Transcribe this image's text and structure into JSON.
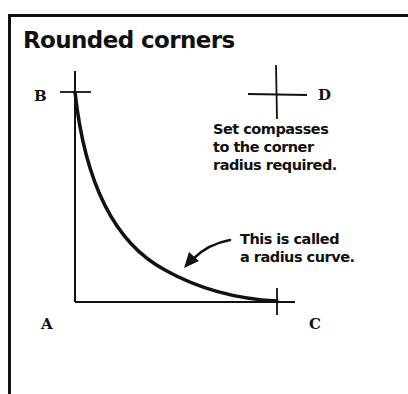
{
  "title": "Rounded corners",
  "points": {
    "A": "A",
    "B": "B",
    "C": "C",
    "D": "D"
  },
  "instruction": {
    "lines": [
      "Set compasses",
      "to the corner",
      "radius required."
    ]
  },
  "callout": {
    "lines": [
      "This is called",
      "a radius curve."
    ]
  },
  "colors": {
    "ink": "#111111",
    "background": "#ffffff"
  }
}
